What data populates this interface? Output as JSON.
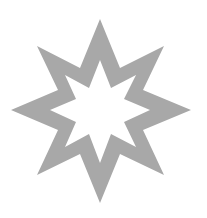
{
  "image": {
    "width": 207,
    "height": 218,
    "background": "#ffffff"
  },
  "shape": {
    "type": "eight-pointed-star-outline",
    "fill": "#a8a8a8",
    "outer_points": "100,19 120,68 164,46 143,90 191,110 143,130 164,175 120,154 100,203 80,154 37,175 58,130 11,110 58,90 37,46 80,68",
    "inner_points": "100,60 111,88 136,75 124,99 150,110 124,122 136,147 111,134 100,163 89,134 65,147 76,122 50,110 76,99 65,75 89,88"
  }
}
